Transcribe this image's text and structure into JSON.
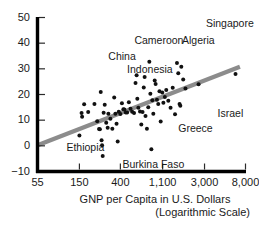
{
  "chart_data": {
    "type": "scatter",
    "title": "",
    "xlabel": "GNP per Capita in U.S. Dollars",
    "xlabel_sub": "(Logarithmic Scale)",
    "ylabel": "",
    "xscale": "log",
    "xlim": [
      55,
      8000
    ],
    "ylim": [
      -10,
      50
    ],
    "grid": false,
    "legend": false,
    "xticks": [
      55,
      150,
      400,
      1100,
      3000,
      8000
    ],
    "xtick_labels": [
      "55",
      "150",
      "400",
      "1,100",
      "3,000",
      "8,000"
    ],
    "yticks": [
      -10,
      0,
      10,
      20,
      30,
      40,
      50
    ],
    "ytick_labels": [
      "−10",
      "0",
      "10",
      "20",
      "30",
      "40",
      "50"
    ],
    "point_color": "#111111",
    "line_color": "#8c8c8c",
    "axis_color": "#000000",
    "trendline": {
      "x0": 55,
      "y0": 0.2,
      "x1": 7000,
      "y1": 30.8
    },
    "annotations": [
      {
        "text": "Singapore",
        "x": 3100,
        "y": 47.5
      },
      {
        "text": "Cameroon",
        "x": 560,
        "y": 41.0
      },
      {
        "text": "Algeria",
        "x": 1750,
        "y": 41.0
      },
      {
        "text": "China",
        "x": 300,
        "y": 34.5
      },
      {
        "text": "Indonesia",
        "x": 470,
        "y": 29.5
      },
      {
        "text": "Israel",
        "x": 4100,
        "y": 12.5
      },
      {
        "text": "Greece",
        "x": 1600,
        "y": 6.5
      },
      {
        "text": "Ethiopia",
        "x": 110,
        "y": -1.0
      },
      {
        "text": "Burkina Faso",
        "x": 420,
        "y": -7.5
      }
    ],
    "points": [
      {
        "x": 150,
        "y": 4.0
      },
      {
        "x": 158,
        "y": 12.8
      },
      {
        "x": 160,
        "y": 11.3
      },
      {
        "x": 168,
        "y": 16.2
      },
      {
        "x": 185,
        "y": 13.2
      },
      {
        "x": 215,
        "y": 16.3
      },
      {
        "x": 230,
        "y": 9.6
      },
      {
        "x": 240,
        "y": 6.6
      },
      {
        "x": 245,
        "y": 6.5
      },
      {
        "x": 250,
        "y": 21.0
      },
      {
        "x": 255,
        "y": 2.2
      },
      {
        "x": 258,
        "y": 0.2
      },
      {
        "x": 262,
        "y": -4.0
      },
      {
        "x": 268,
        "y": 12.9
      },
      {
        "x": 275,
        "y": 16.0
      },
      {
        "x": 285,
        "y": 9.0
      },
      {
        "x": 295,
        "y": 7.0
      },
      {
        "x": 300,
        "y": 12.5
      },
      {
        "x": 315,
        "y": 10.6
      },
      {
        "x": 330,
        "y": 6.7
      },
      {
        "x": 345,
        "y": 18.8
      },
      {
        "x": 355,
        "y": 12.5
      },
      {
        "x": 365,
        "y": 8.6
      },
      {
        "x": 375,
        "y": 1.7
      },
      {
        "x": 385,
        "y": 13.3
      },
      {
        "x": 400,
        "y": 12.4
      },
      {
        "x": 415,
        "y": 16.6
      },
      {
        "x": 430,
        "y": 14.3
      },
      {
        "x": 440,
        "y": 14.2
      },
      {
        "x": 455,
        "y": 13.0
      },
      {
        "x": 470,
        "y": 13.0
      },
      {
        "x": 490,
        "y": 17.0
      },
      {
        "x": 510,
        "y": 14.4
      },
      {
        "x": 530,
        "y": 13.3
      },
      {
        "x": 555,
        "y": 12.8
      },
      {
        "x": 575,
        "y": 24.5
      },
      {
        "x": 590,
        "y": 27.5
      },
      {
        "x": 600,
        "y": 18.3
      },
      {
        "x": 615,
        "y": 14.8
      },
      {
        "x": 640,
        "y": 13.4
      },
      {
        "x": 660,
        "y": 8.3
      },
      {
        "x": 680,
        "y": 13.2
      },
      {
        "x": 700,
        "y": 22.7
      },
      {
        "x": 715,
        "y": 26.8
      },
      {
        "x": 730,
        "y": 11.6
      },
      {
        "x": 755,
        "y": 6.7
      },
      {
        "x": 780,
        "y": 15.0
      },
      {
        "x": 800,
        "y": 32.8
      },
      {
        "x": 820,
        "y": 20.3
      },
      {
        "x": 840,
        "y": -1.3
      },
      {
        "x": 860,
        "y": 17.8
      },
      {
        "x": 880,
        "y": 12.5
      },
      {
        "x": 910,
        "y": 25.5
      },
      {
        "x": 930,
        "y": 24.1
      },
      {
        "x": 960,
        "y": 18.0
      },
      {
        "x": 990,
        "y": 16.3
      },
      {
        "x": 1020,
        "y": 21.3
      },
      {
        "x": 1050,
        "y": 9.5
      },
      {
        "x": 1090,
        "y": 20.8
      },
      {
        "x": 1120,
        "y": 16.8
      },
      {
        "x": 1160,
        "y": 19.0
      },
      {
        "x": 1200,
        "y": 21.8
      },
      {
        "x": 1260,
        "y": 17.6
      },
      {
        "x": 1330,
        "y": 14.8
      },
      {
        "x": 1400,
        "y": 22.6
      },
      {
        "x": 1480,
        "y": 12.3
      },
      {
        "x": 1550,
        "y": 32.3
      },
      {
        "x": 1600,
        "y": 28.3
      },
      {
        "x": 1650,
        "y": 16.3
      },
      {
        "x": 1680,
        "y": 15.6
      },
      {
        "x": 1720,
        "y": 30.8
      },
      {
        "x": 1800,
        "y": 25.8
      },
      {
        "x": 1900,
        "y": 22.3
      },
      {
        "x": 2600,
        "y": 24.0
      },
      {
        "x": 6300,
        "y": 28.0
      }
    ]
  }
}
